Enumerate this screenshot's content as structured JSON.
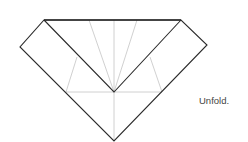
{
  "diagram": {
    "type": "origami-fold-step",
    "instruction": "Unfold.",
    "colors": {
      "fold_edge": "#2a2a2a",
      "crease": "#c4c4c4",
      "background": "#ffffff"
    }
  }
}
